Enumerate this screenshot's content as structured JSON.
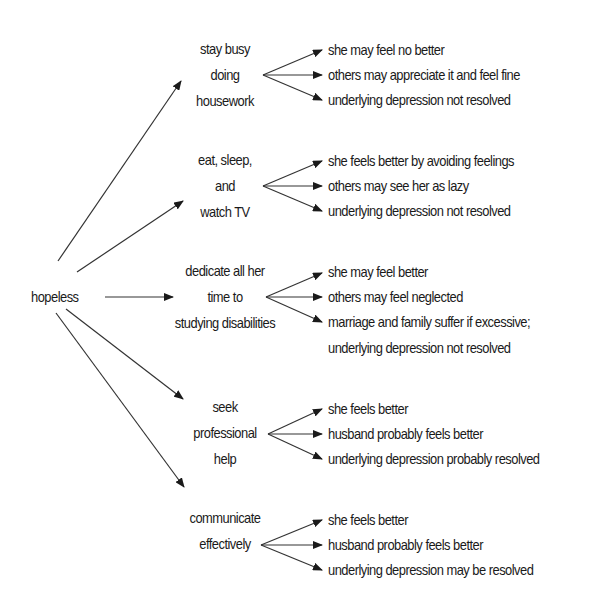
{
  "root": {
    "label": "hopeless"
  },
  "branches": [
    {
      "lines": [
        "stay busy",
        "doing",
        "housework"
      ],
      "outcomes": [
        "she may feel no better",
        "others may appreciate it and feel fine",
        "underlying depression not resolved"
      ]
    },
    {
      "lines": [
        "eat, sleep,",
        "and",
        "watch TV"
      ],
      "outcomes": [
        "she feels better by avoiding feelings",
        "others may see her as lazy",
        "underlying depression not resolved"
      ]
    },
    {
      "lines": [
        "dedicate all her",
        "time to",
        "studying disabilities"
      ],
      "outcomes": [
        "she may feel better",
        "others may feel neglected",
        "marriage and family suffer if excessive;",
        "underlying depression not resolved"
      ]
    },
    {
      "lines": [
        "seek",
        "professional",
        "help"
      ],
      "outcomes": [
        "she feels better",
        "husband probably feels better",
        "underlying depression probably resolved"
      ]
    },
    {
      "lines": [
        "communicate",
        "effectively"
      ],
      "outcomes": [
        "she feels better",
        "husband probably feels better",
        "underlying depression may be resolved"
      ]
    }
  ],
  "colors": {
    "ink": "#1a1a1a",
    "background": "#ffffff"
  }
}
